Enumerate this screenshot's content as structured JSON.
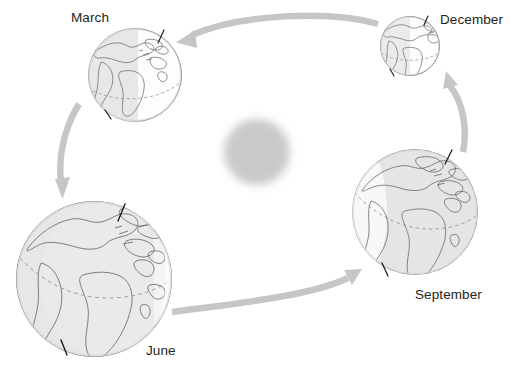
{
  "diagram": {
    "type": "orbit-diagram",
    "background_color": "#ffffff",
    "sun": {
      "name": "Sun",
      "center": [
        257,
        152
      ],
      "radius": 35,
      "color": "#c9c9c9",
      "blurred": true
    },
    "orbit_direction": "counter-clockwise",
    "arrow_color": "#c6c6c6",
    "globe": {
      "outline_color": "#6e6e6e",
      "coastline_color": "#5a5a5a",
      "equator_color": "#9a8f8f",
      "lit_color": "#fbfbfb",
      "shadow_color": "#dededd",
      "axis_color": "#1a1a1a"
    },
    "positions": [
      {
        "id": "march",
        "label": "March",
        "label_position": [
          71,
          10
        ],
        "center": [
          135,
          75
        ],
        "radius": 47,
        "axis_tilt_deg": -23.5,
        "shadow_side": "left"
      },
      {
        "id": "december",
        "label": "December",
        "label_position": [
          440,
          12
        ],
        "center": [
          410,
          46
        ],
        "radius": 30,
        "axis_tilt_deg": -23.5,
        "shadow_side": "left"
      },
      {
        "id": "june",
        "label": "June",
        "label_position": [
          146,
          343
        ],
        "center": [
          94,
          279
        ],
        "radius": 78,
        "axis_tilt_deg": -23.5,
        "shadow_side": "right"
      },
      {
        "id": "september",
        "label": "September",
        "label_position": [
          415,
          287
        ],
        "center": [
          415,
          212
        ],
        "radius": 63,
        "axis_tilt_deg": -23.5,
        "shadow_side": "left"
      }
    ],
    "arrows": [
      {
        "id": "arrow-december-to-march",
        "from": "december",
        "to": "march",
        "direction": "left"
      },
      {
        "id": "arrow-march-to-june",
        "from": "march",
        "to": "june",
        "direction": "down"
      },
      {
        "id": "arrow-june-to-september",
        "from": "june",
        "to": "september",
        "direction": "right"
      },
      {
        "id": "arrow-september-to-december",
        "from": "september",
        "to": "december",
        "direction": "up"
      }
    ]
  }
}
